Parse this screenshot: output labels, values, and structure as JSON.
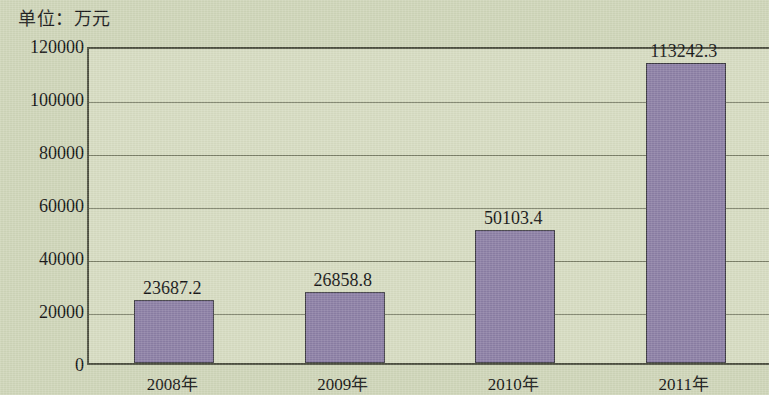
{
  "caption": "单位：万元",
  "chart_data": {
    "type": "bar",
    "title": "",
    "subtitle": "",
    "xlabel": "",
    "ylabel": "单位：万元",
    "categories": [
      "2008年",
      "2009年",
      "2010年",
      "2011年"
    ],
    "values": [
      23687.2,
      26858.8,
      50103.4,
      113242.3
    ],
    "value_labels": [
      "23687.2",
      "26858.8",
      "50103.4",
      "113242.3"
    ],
    "ylim": [
      0,
      120000
    ],
    "yticks": [
      0,
      20000,
      40000,
      60000,
      80000,
      100000,
      120000
    ],
    "ytick_labels": [
      "0",
      "20000",
      "40000",
      "60000",
      "80000",
      "100000",
      "120000"
    ],
    "grid": true,
    "legend": false,
    "legend_position": "none",
    "bar_color": "#8c7fa5",
    "bar_edge_color": "#3c3a42",
    "plot_background": "#d7dcc2",
    "figure_background": "#cfd6b9",
    "axis_color": "#4c4f3f",
    "gridline_color": "#6b6e58",
    "text_color": "#141414"
  }
}
